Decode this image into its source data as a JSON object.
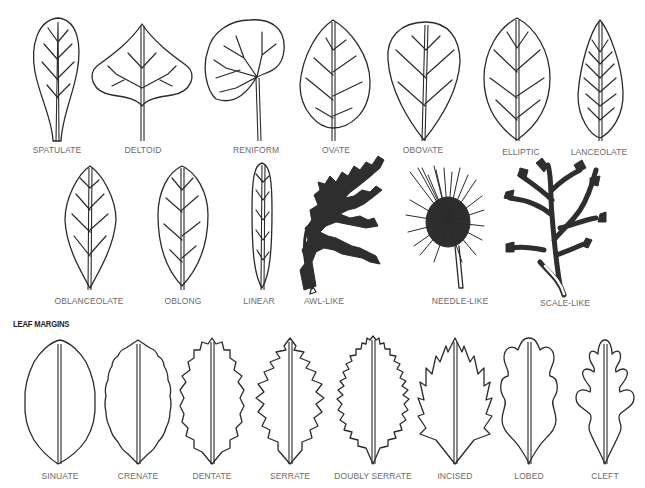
{
  "leaf_shapes": {
    "row1": [
      {
        "label": "SPATULATE",
        "x": 57,
        "y": 145
      },
      {
        "label": "DELTOID",
        "x": 143,
        "y": 145
      },
      {
        "label": "RENIFORM",
        "x": 256,
        "y": 145
      },
      {
        "label": "OVATE",
        "x": 336,
        "y": 145
      },
      {
        "label": "OBOVATE",
        "x": 423,
        "y": 145
      },
      {
        "label": "ELLIPTIC",
        "x": 521,
        "y": 147
      },
      {
        "label": "LANCEOLATE",
        "x": 599,
        "y": 147
      }
    ],
    "row2": [
      {
        "label": "OBLANCEOLATE",
        "x": 89,
        "y": 296
      },
      {
        "label": "OBLONG",
        "x": 183,
        "y": 296
      },
      {
        "label": "LINEAR",
        "x": 259,
        "y": 296
      },
      {
        "label": "AWL-LIKE",
        "x": 324,
        "y": 296
      },
      {
        "label": "NEEDLE-LIKE",
        "x": 460,
        "y": 296
      },
      {
        "label": "SCALE-LIKE",
        "x": 565,
        "y": 298
      }
    ]
  },
  "leaf_margins": {
    "heading": "LEAF MARGINS",
    "items": [
      {
        "label": "SINUATE",
        "x": 60,
        "y": 471
      },
      {
        "label": "CRENATE",
        "x": 138,
        "y": 471
      },
      {
        "label": "DENTATE",
        "x": 212,
        "y": 471
      },
      {
        "label": "SERRATE",
        "x": 290,
        "y": 471
      },
      {
        "label": "DOUBLY SERRATE",
        "x": 373,
        "y": 471
      },
      {
        "label": "INCISED",
        "x": 455,
        "y": 471
      },
      {
        "label": "LOBED",
        "x": 529,
        "y": 471
      },
      {
        "label": "CLEFT",
        "x": 605,
        "y": 471
      }
    ]
  }
}
